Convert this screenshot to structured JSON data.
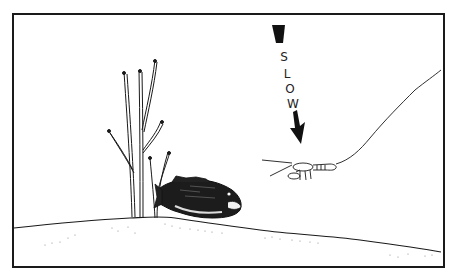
{
  "illustration": {
    "annotation": {
      "letters": [
        "S",
        "L",
        "O",
        "W"
      ],
      "direction": "down",
      "meaning": "slow"
    },
    "elements": [
      "bare-tree-branches",
      "largemouth-bass",
      "crayfish-lure",
      "fishing-line",
      "lake-bottom"
    ],
    "colors": {
      "ink": "#1a1a1a",
      "background": "#ffffff"
    }
  }
}
